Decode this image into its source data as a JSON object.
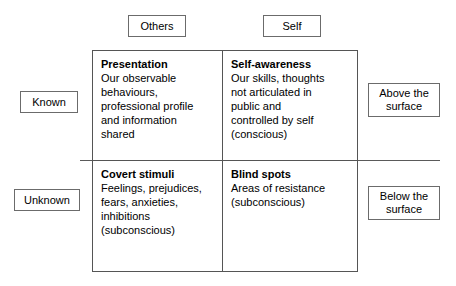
{
  "diagram": {
    "column_headers": [
      {
        "name": "others",
        "label": "Others"
      },
      {
        "name": "self",
        "label": "Self"
      }
    ],
    "row_headers": [
      {
        "name": "known",
        "label": "Known"
      },
      {
        "name": "unknown",
        "label": "Unknown"
      }
    ],
    "right_labels": [
      {
        "name": "above-the-surface",
        "label": "Above the\nsurface"
      },
      {
        "name": "below-the-surface",
        "label": "Below the\nsurface"
      }
    ],
    "quadrants": [
      {
        "name": "presentation",
        "title": "Presentation",
        "body": "Our observable\nbehaviours,\nprofessional profile\nand information\nshared"
      },
      {
        "name": "self-awareness",
        "title": "Self-awareness",
        "body": "Our skills, thoughts\nnot articulated in\npublic and\ncontrolled by self\n(conscious)"
      },
      {
        "name": "covert-stimuli",
        "title": "Covert stimuli",
        "body": "Feelings, prejudices,\nfears, anxieties,\ninhibitions\n(subconscious)"
      },
      {
        "name": "blind-spots",
        "title": "Blind spots",
        "body": "Areas of resistance\n(subconscious)"
      }
    ]
  }
}
